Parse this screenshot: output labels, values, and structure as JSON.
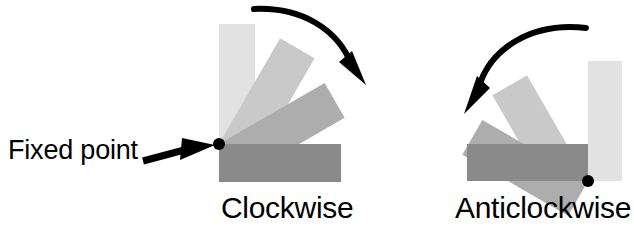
{
  "figure": {
    "background_color": "#ffffff",
    "width": 634,
    "height": 238
  },
  "annotations": {
    "fixed_point_label": "Fixed point",
    "clockwise_label": "Clockwise",
    "anticlockwise_label": "Anticlockwise"
  },
  "colors": {
    "bar_lightest": "#e2e2e2",
    "bar_light": "#c9c9c9",
    "bar_medium": "#adadad",
    "bar_dark": "#8a8a8a",
    "pivot_dot": "#000000",
    "arrow": "#000000",
    "text": "#000000"
  },
  "diagrams": [
    {
      "name": "clockwise",
      "label": "Clockwise",
      "pivot": {
        "x": 219,
        "y": 144
      },
      "rotation_direction": "clockwise",
      "bar_count": 4,
      "bars": [
        {
          "shade": "#e2e2e2",
          "angle_deg": 0,
          "length": 120,
          "width": 36,
          "position": "vertical-up"
        },
        {
          "shade": "#c9c9c9",
          "angle_deg": 30,
          "length": 122,
          "width": 40,
          "position": "tilted-30"
        },
        {
          "shade": "#adadad",
          "angle_deg": 60,
          "length": 122,
          "width": 40,
          "position": "tilted-60"
        },
        {
          "shade": "#8a8a8a",
          "angle_deg": 90,
          "length": 122,
          "width": 38,
          "position": "horizontal"
        }
      ],
      "arrow": {
        "from": "top-left",
        "to": "right",
        "direction": "clockwise"
      }
    },
    {
      "name": "anticlockwise",
      "label": "Anticlockwise",
      "pivot": {
        "x": 588,
        "y": 181
      },
      "rotation_direction": "anticlockwise",
      "bar_count": 4,
      "bars": [
        {
          "shade": "#e2e2e2",
          "angle_deg": 0,
          "length": 120,
          "width": 34,
          "position": "vertical-up"
        },
        {
          "shade": "#c9c9c9",
          "angle_deg": -30,
          "length": 122,
          "width": 40,
          "position": "tilted-30"
        },
        {
          "shade": "#adadad",
          "angle_deg": -60,
          "length": 122,
          "width": 40,
          "position": "tilted-60"
        },
        {
          "shade": "#8a8a8a",
          "angle_deg": -90,
          "length": 121,
          "width": 37,
          "position": "horizontal"
        }
      ],
      "arrow": {
        "from": "top-right",
        "to": "left",
        "direction": "anticlockwise"
      }
    }
  ]
}
